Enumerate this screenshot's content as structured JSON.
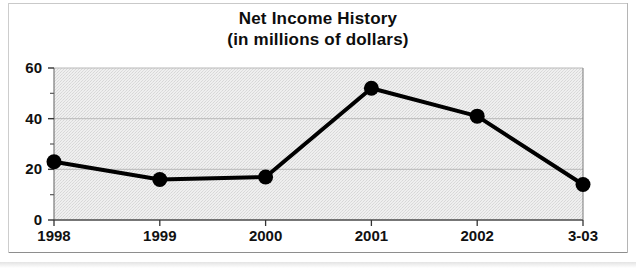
{
  "chart_data": {
    "type": "line",
    "title": "Net Income History",
    "subtitle": "(in millions of dollars)",
    "xlabel": "",
    "ylabel": "",
    "categories": [
      "1998",
      "1999",
      "2000",
      "2001",
      "2002",
      "3-03"
    ],
    "values": [
      23,
      16,
      17,
      52,
      41,
      14
    ],
    "series": [
      {
        "name": "Net Income",
        "values": [
          23,
          16,
          17,
          52,
          41,
          14
        ]
      }
    ],
    "ylim": [
      0,
      60
    ],
    "ytick_labels": [
      "0",
      "20",
      "40",
      "60"
    ],
    "ytick_values": [
      0,
      20,
      40,
      60
    ],
    "yminor_ticks": [
      10,
      30,
      50
    ],
    "grid": true,
    "legend": "none",
    "line_color": "#000000",
    "marker": "circle",
    "marker_color": "#000000",
    "plot_background": "#ececec",
    "gridline_color": "#b9b9b9",
    "axis_color": "#7a7a7a"
  },
  "figure": {
    "background": "#ffffff",
    "border_color": "#bdbdbd"
  }
}
